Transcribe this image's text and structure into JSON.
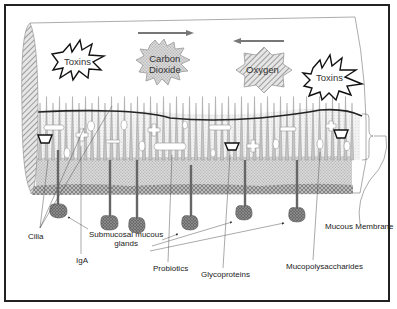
{
  "diagram": {
    "bursts": [
      {
        "id": "toxins-left",
        "label": "Toxins",
        "style": "black-outline-star"
      },
      {
        "id": "carbon-dioxide",
        "label_line1": "Carbon",
        "label_line2": "Dioxide",
        "style": "gray-dotted-star",
        "arrow": "right"
      },
      {
        "id": "oxygen",
        "label": "Oxygen",
        "style": "gray-hatched-octagram",
        "arrow": "left"
      },
      {
        "id": "toxins-right",
        "label": "Toxins",
        "style": "black-outline-star"
      }
    ],
    "labels": {
      "cilia": "Cilia",
      "submucosal_line1": "Submucosal mucous",
      "submucosal_line2": "glands",
      "iga": "IgA",
      "probiotics": "Probiotics",
      "glycoproteins": "Glycoproteins",
      "mucopolysaccharides": "Mucopolysaccharides",
      "mucous_membrane": "Mucous Membrane"
    },
    "colors": {
      "border": "#222222",
      "gland": "#666666",
      "epithelium": "#cfcfcf",
      "mucus_line": "#222222",
      "hatch": "#999999"
    }
  }
}
